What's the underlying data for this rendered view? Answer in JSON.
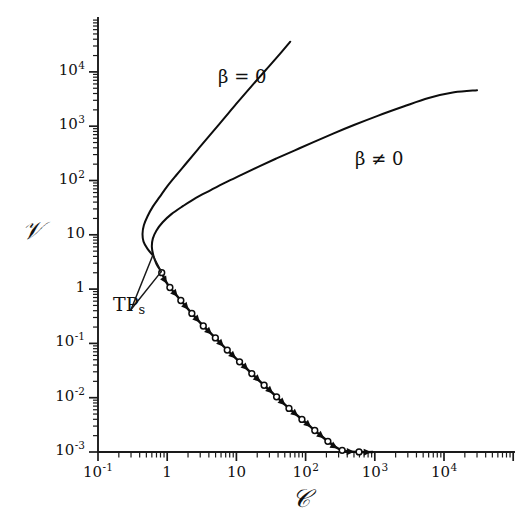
{
  "chart_data": {
    "type": "line",
    "title": "",
    "xlabel": "C",
    "ylabel": "V",
    "xscale": "log",
    "yscale": "log",
    "xlim": [
      0.1,
      50000
    ],
    "ylim": [
      0.001,
      50000
    ],
    "grid": false,
    "legend_position": "inline-annotations",
    "x_tick_labels": [
      "10",
      "1",
      "10",
      "10",
      "10",
      "10"
    ],
    "x_tick_exponents": [
      "-1",
      "",
      "",
      "2",
      "3",
      "4"
    ],
    "x_ticks": [
      {
        "base": "10",
        "exp": "-1",
        "value": 0.1
      },
      {
        "base": "1",
        "exp": "",
        "value": 1
      },
      {
        "base": "10",
        "exp": "",
        "value": 10
      },
      {
        "base": "10",
        "exp": "2",
        "value": 100
      },
      {
        "base": "10",
        "exp": "3",
        "value": 1000
      },
      {
        "base": "10",
        "exp": "4",
        "value": 10000
      }
    ],
    "y_ticks": [
      {
        "base": "10",
        "exp": "4",
        "value": 10000
      },
      {
        "base": "10",
        "exp": "3",
        "value": 1000
      },
      {
        "base": "10",
        "exp": "2",
        "value": 100
      },
      {
        "base": "10",
        "exp": "",
        "value": 10
      },
      {
        "base": "1",
        "exp": "",
        "value": 1
      },
      {
        "base": "10",
        "exp": "-1",
        "value": 0.1
      },
      {
        "base": "10",
        "exp": "-2",
        "value": 0.01
      },
      {
        "base": "10",
        "exp": "-3",
        "value": 0.001
      }
    ],
    "series": [
      {
        "name": "beta = 0",
        "label": "β = 0",
        "style": "solid",
        "description": "S-shaped branch folding back at a turning point near C=0.45, rising steeply to upper right",
        "points": [
          [
            0.62,
            4.2
          ],
          [
            0.52,
            5.5
          ],
          [
            0.455,
            7.5
          ],
          [
            0.44,
            10.5
          ],
          [
            0.46,
            15.0
          ],
          [
            0.52,
            22.0
          ],
          [
            0.62,
            33.0
          ],
          [
            0.78,
            50.0
          ],
          [
            1.0,
            78.0
          ],
          [
            1.35,
            125.0
          ],
          [
            1.9,
            210.0
          ],
          [
            2.8,
            380.0
          ],
          [
            4.2,
            700.0
          ],
          [
            6.5,
            1350.0
          ],
          [
            10.0,
            2600.0
          ],
          [
            16.0,
            5200.0
          ],
          [
            26.0,
            10500.0
          ],
          [
            42.0,
            21000.0
          ],
          [
            60.0,
            36000.0
          ]
        ],
        "label_position": [
          3.1,
          4800
        ]
      },
      {
        "name": "beta != 0",
        "label": "β ≠ 0",
        "style": "solid",
        "description": "S-shaped branch folding back at a turning point near C=0.62, rising with shallower slope to upper right",
        "points": [
          [
            0.82,
            2.1
          ],
          [
            0.7,
            2.9
          ],
          [
            0.63,
            4.2
          ],
          [
            0.6,
            6.0
          ],
          [
            0.62,
            8.5
          ],
          [
            0.7,
            12.0
          ],
          [
            0.86,
            17.0
          ],
          [
            1.15,
            24.0
          ],
          [
            1.7,
            34.0
          ],
          [
            2.6,
            48.0
          ],
          [
            4.2,
            66.0
          ],
          [
            7.0,
            92.0
          ],
          [
            12.0,
            128.0
          ],
          [
            21.0,
            180.0
          ],
          [
            38.0,
            255.0
          ],
          [
            70.0,
            360.0
          ],
          [
            130.0,
            510.0
          ],
          [
            250.0,
            730.0
          ],
          [
            500.0,
            1050.0
          ],
          [
            1100.0,
            1550.0
          ],
          [
            2600.0,
            2300.0
          ],
          [
            6000.0,
            3300.0
          ],
          [
            14000.0,
            4200.0
          ],
          [
            30000.0,
            4600.0
          ]
        ],
        "label_position": [
          2000,
          180
        ]
      },
      {
        "name": "unstable-dashed-branch",
        "label": "",
        "style": "dashed-with-markers-and-arrows",
        "description": "Descending unstable branch, dashed with alternating open-circle markers and arrowheads, slope approximately -1 on log-log",
        "points": [
          [
            0.82,
            2.1
          ],
          [
            1.0,
            1.25
          ],
          [
            1.45,
            0.7
          ],
          [
            2.1,
            0.4
          ],
          [
            3.2,
            0.22
          ],
          [
            5.0,
            0.125
          ],
          [
            8.0,
            0.068
          ],
          [
            13.0,
            0.038
          ],
          [
            21.0,
            0.021
          ],
          [
            35.0,
            0.0115
          ],
          [
            58.0,
            0.0063
          ],
          [
            100.0,
            0.0035
          ],
          [
            175.0,
            0.0019
          ],
          [
            320.0,
            0.0011
          ],
          [
            600.0,
            0.001
          ],
          [
            1000.0,
            0.001
          ]
        ]
      }
    ],
    "annotations": [
      {
        "name": "turning-points",
        "text": "TP",
        "subscript": "s",
        "label_position": [
          0.3,
          0.42
        ],
        "points_to": [
          [
            0.62,
            4.2
          ],
          [
            0.82,
            2.1
          ]
        ]
      }
    ]
  },
  "axes": {
    "y_title": "𝒱",
    "x_title": "𝒞"
  },
  "curve_labels": {
    "beta_zero": "β = 0",
    "beta_nonzero": "β ≠ 0"
  },
  "annotation": {
    "tp_text": "TP",
    "tp_subscript": "s"
  },
  "colors": {
    "ink": "#111111",
    "background": "#ffffff",
    "curve": "#0d0d0d"
  }
}
